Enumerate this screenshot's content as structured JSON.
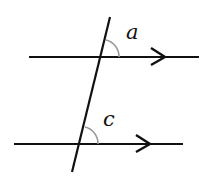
{
  "diagram": {
    "type": "parallel-lines-transversal",
    "colors": {
      "line": "#111111",
      "arc": "#999999",
      "background": "#ffffff"
    },
    "angles": [
      {
        "label": "a",
        "position": "upper intersection, above parallel line, right of transversal"
      },
      {
        "label": "c",
        "position": "lower intersection, above parallel line, right of transversal"
      }
    ],
    "parallel_markers": [
      "arrow",
      "arrow"
    ]
  }
}
